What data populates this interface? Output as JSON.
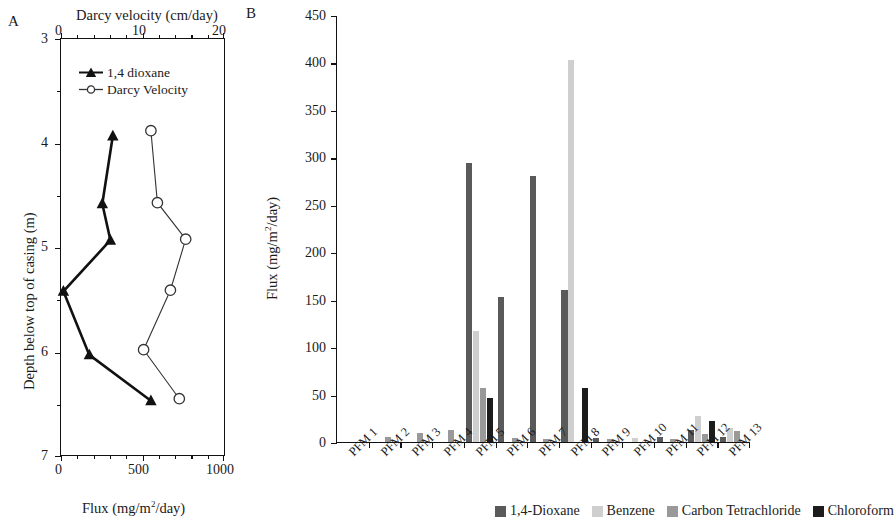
{
  "panel_a": {
    "letter": "A",
    "top_axis_title": "Darcy velocity (cm/day)",
    "top_ticks": [
      "0",
      "10",
      "20"
    ],
    "top_range": [
      0,
      20
    ],
    "bottom_axis_title_pre": "Flux (mg/m",
    "bottom_axis_title_sup": "2",
    "bottom_axis_title_post": "/day)",
    "bottom_axis_title": "Flux (mg/m2/day)",
    "bottom_ticks": [
      "0",
      "500",
      "1000"
    ],
    "bottom_range": [
      0,
      1000
    ],
    "y_axis_title": "Depth below top of casing (m)",
    "y_ticks": [
      "3",
      "4",
      "5",
      "6",
      "7"
    ],
    "y_range": [
      3,
      7
    ],
    "legend": [
      {
        "label": "1,4 dioxane",
        "marker": "filled-triangle",
        "color": "#111111"
      },
      {
        "label": "Darcy Velocity",
        "marker": "open-circle",
        "color": "#333333"
      }
    ]
  },
  "panel_b": {
    "letter": "B",
    "y_axis_title_pre": "Flux (mg/m",
    "y_axis_title_sup": "2",
    "y_axis_title_post": "/day)",
    "y_axis_title": "Flux (mg/m2/day)",
    "y_ticks": [
      "0",
      "50",
      "100",
      "150",
      "200",
      "250",
      "300",
      "350",
      "400",
      "450"
    ],
    "legend": [
      {
        "label": "1,4-Dioxane",
        "color": "#5a5a5a"
      },
      {
        "label": "Benzene",
        "color": "#cfcfcf"
      },
      {
        "label": "Carbon Tetrachloride",
        "color": "#999999"
      },
      {
        "label": "Chloroform",
        "color": "#1c1c1c"
      }
    ]
  },
  "chart_data": [
    {
      "type": "line",
      "title": "A",
      "xlabel": "Flux (mg/m2/day)",
      "xlabel_top": "Darcy velocity (cm/day)",
      "ylabel": "Depth below top of casing (m)",
      "xlim": [
        0,
        1000
      ],
      "xlim_top": [
        0,
        20
      ],
      "ylim": [
        7,
        3
      ],
      "y_inverted": true,
      "grid": false,
      "legend_position": "upper-left-inside",
      "series": [
        {
          "name": "1,4 dioxane",
          "axis": "bottom",
          "marker": "filled-triangle",
          "color": "#111111",
          "points": [
            {
              "x": 320,
              "y": 3.93
            },
            {
              "x": 255,
              "y": 4.58
            },
            {
              "x": 305,
              "y": 4.93
            },
            {
              "x": 15,
              "y": 5.42
            },
            {
              "x": 175,
              "y": 6.03
            },
            {
              "x": 555,
              "y": 6.47
            }
          ]
        },
        {
          "name": "Darcy Velocity",
          "axis": "top",
          "marker": "open-circle",
          "color": "#333333",
          "points": [
            {
              "x": 11.1,
              "y": 3.88
            },
            {
              "x": 11.9,
              "y": 4.57
            },
            {
              "x": 15.4,
              "y": 4.92
            },
            {
              "x": 13.5,
              "y": 5.41
            },
            {
              "x": 10.2,
              "y": 5.98
            },
            {
              "x": 14.6,
              "y": 6.45
            }
          ]
        }
      ]
    },
    {
      "type": "bar",
      "title": "B",
      "xlabel": "",
      "ylabel": "Flux (mg/m2/day)",
      "ylim": [
        0,
        450
      ],
      "grid": false,
      "legend_position": "bottom",
      "categories": [
        "PFM 1",
        "PFM 2",
        "PFM 3",
        "PFM 4",
        "PFM 5",
        "PFM 6",
        "PFM 7",
        "PFM 8",
        "PFM 9",
        "PFM 10",
        "PFM 11",
        "PFM 12",
        "PFM 13"
      ],
      "series": [
        {
          "name": "1,4-Dioxane",
          "color": "#5a5a5a",
          "values": [
            0,
            0,
            0,
            0,
            294,
            153,
            280,
            160,
            4,
            0,
            5,
            13,
            5
          ]
        },
        {
          "name": "Benzene",
          "color": "#cfcfcf",
          "values": [
            0,
            0,
            0,
            0,
            117,
            0,
            0,
            403,
            0,
            4,
            0,
            27,
            15
          ]
        },
        {
          "name": "Carbon Tetrachloride",
          "color": "#999999",
          "values": [
            0,
            5,
            10,
            13,
            57,
            4,
            3,
            0,
            3,
            0,
            3,
            8,
            12
          ]
        },
        {
          "name": "Chloroform",
          "color": "#1c1c1c",
          "values": [
            0,
            0,
            0,
            0,
            46,
            0,
            0,
            57,
            0,
            0,
            0,
            22,
            0
          ]
        }
      ]
    }
  ]
}
